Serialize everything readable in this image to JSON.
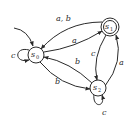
{
  "diagram": {
    "type": "finite-state-automaton",
    "states": [
      {
        "id": "s0",
        "label": "s",
        "subscript": "0",
        "start": true,
        "accepting": false
      },
      {
        "id": "s1",
        "label": "s",
        "subscript": "1",
        "start": false,
        "accepting": true
      },
      {
        "id": "s2",
        "label": "s",
        "subscript": "2",
        "start": false,
        "accepting": false
      }
    ],
    "transitions": [
      {
        "from": "s1",
        "to": "s0",
        "label": "a, b"
      },
      {
        "from": "s0",
        "to": "s1",
        "label": "a"
      },
      {
        "from": "s1",
        "to": "s2",
        "label": "c"
      },
      {
        "from": "s2",
        "to": "s1",
        "label": "a"
      },
      {
        "from": "s2",
        "to": "s0",
        "label": "b"
      },
      {
        "from": "s0",
        "to": "s2",
        "label": "b"
      },
      {
        "from": "s0",
        "to": "s0",
        "label": "c"
      },
      {
        "from": "s2",
        "to": "s2",
        "label": "c"
      }
    ],
    "colors": {
      "stroke": "#2a2a2a",
      "background": "#ffffff"
    }
  }
}
